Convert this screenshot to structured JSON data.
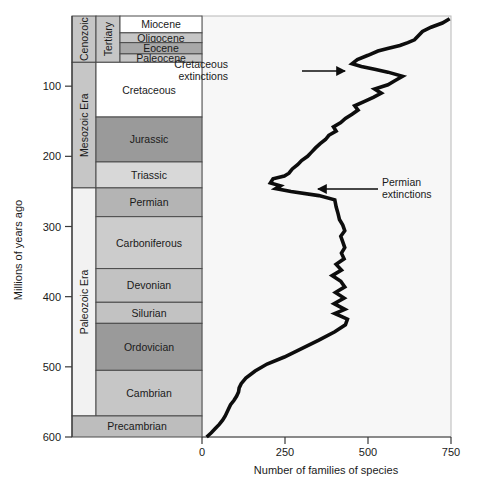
{
  "figure": {
    "width": 477,
    "height": 494
  },
  "axes": {
    "y_title": "Millions of years ago",
    "y_ticks": [
      "100",
      "200",
      "300",
      "400",
      "500",
      "600"
    ],
    "y_tick_values": [
      100,
      200,
      300,
      400,
      500,
      600
    ],
    "y_range": [
      0,
      600
    ],
    "x_title": "Number of families of species",
    "x_ticks": [
      "0",
      "250",
      "500",
      "750"
    ],
    "x_tick_values": [
      0,
      250,
      500,
      750
    ],
    "x_range": [
      0,
      750
    ]
  },
  "eras": [
    {
      "name": "Cenozoic",
      "label": "Cenozoic",
      "start": 0,
      "end": 66,
      "fill": "#c6c6c6"
    },
    {
      "name": "Mesozoic",
      "label": "Mesozoic Era",
      "start": 66,
      "end": 245,
      "fill": "#c6c6c6"
    },
    {
      "name": "Paleozoic",
      "label": "Paleozoic Era",
      "start": 245,
      "end": 570,
      "fill": "#f2f2f2"
    }
  ],
  "periods": [
    {
      "name": "Tertiary",
      "label": "Tertiary",
      "start": 0,
      "end": 66,
      "fill": "#c6c6c6"
    }
  ],
  "bands": [
    {
      "name": "Miocene",
      "label": "Miocene",
      "start": 0,
      "end": 24,
      "fill": "#ffffff",
      "col": "epoch"
    },
    {
      "name": "Oligocene",
      "label": "Oligocene",
      "start": 24,
      "end": 38,
      "fill": "#c6c6c6",
      "col": "epoch"
    },
    {
      "name": "Eocene",
      "label": "Eocene",
      "start": 38,
      "end": 54,
      "fill": "#a8a8a8",
      "col": "epoch"
    },
    {
      "name": "Paleocene",
      "label": "Paleocene",
      "start": 54,
      "end": 66,
      "fill": "#c6c6c6",
      "col": "epoch"
    },
    {
      "name": "Cretaceous",
      "label": "Cretaceous",
      "start": 66,
      "end": 144,
      "fill": "#ffffff",
      "col": "period"
    },
    {
      "name": "Jurassic",
      "label": "Jurassic",
      "start": 144,
      "end": 208,
      "fill": "#9a9a9a",
      "col": "period"
    },
    {
      "name": "Triassic",
      "label": "Triassic",
      "start": 208,
      "end": 245,
      "fill": "#d8d8d8",
      "col": "period"
    },
    {
      "name": "Permian",
      "label": "Permian",
      "start": 245,
      "end": 286,
      "fill": "#b4b4b4",
      "col": "period"
    },
    {
      "name": "Carboniferous",
      "label": "Carboniferous",
      "start": 286,
      "end": 360,
      "fill": "#cccccc",
      "col": "period"
    },
    {
      "name": "Devonian",
      "label": "Devonian",
      "start": 360,
      "end": 408,
      "fill": "#c2c2c2",
      "col": "period"
    },
    {
      "name": "Silurian",
      "label": "Silurian",
      "start": 408,
      "end": 438,
      "fill": "#c2c2c2",
      "col": "period"
    },
    {
      "name": "Ordovician",
      "label": "Ordovician",
      "start": 438,
      "end": 505,
      "fill": "#9a9a9a",
      "col": "period"
    },
    {
      "name": "Cambrian",
      "label": "Cambrian",
      "start": 505,
      "end": 570,
      "fill": "#c6c6c6",
      "col": "period"
    },
    {
      "name": "Precambrian",
      "label": "Precambrian",
      "start": 570,
      "end": 600,
      "fill": "#bdbdbd",
      "col": "full"
    }
  ],
  "annotations": [
    {
      "name": "cretaceous-extinctions",
      "line1": "Cretaceous",
      "line2": "extinctions",
      "text_x": 228,
      "text_y": 68,
      "arrow_from_x": 302,
      "arrow_to_x": 345,
      "arrow_y": 71
    },
    {
      "name": "permian-extinctions",
      "line1": "Permian",
      "line2": "extinctions",
      "text_x": 382,
      "text_y": 186,
      "arrow_from_x": 378,
      "arrow_to_x": 318,
      "arrow_y": 189
    }
  ],
  "chart_data": {
    "type": "line",
    "xlabel": "Number of families of species",
    "ylabel": "Millions of years ago",
    "xlim": [
      0,
      750
    ],
    "ylim": [
      600,
      0
    ],
    "grid": false,
    "legend": "none",
    "orientation": "x = families, y = time (inverted, 600 Ma at bottom)",
    "series": [
      {
        "name": "Families of species",
        "x": [
          14,
          28,
          40,
          52,
          62,
          70,
          78,
          86,
          96,
          104,
          110,
          112,
          118,
          132,
          160,
          196,
          248,
          300,
          352,
          400,
          432,
          438,
          400,
          430,
          398,
          428,
          402,
          430,
          418,
          392,
          420,
          404,
          428,
          420,
          430,
          424,
          418,
          430,
          424,
          414,
          410,
          404,
          400,
          352,
          268,
          222,
          236,
          206,
          214,
          248,
          262,
          272,
          288,
          300,
          318,
          330,
          342,
          356,
          372,
          382,
          404,
          396,
          418,
          432,
          452,
          470,
          460,
          488,
          516,
          540,
          520,
          560,
          582,
          604,
          560,
          520,
          480,
          452,
          468,
          500,
          530,
          562,
          596,
          620,
          640,
          648,
          656,
          664,
          690,
          724,
          746
        ],
        "y": [
          600,
          594,
          588,
          582,
          576,
          570,
          562,
          554,
          548,
          542,
          536,
          530,
          524,
          516,
          506,
          496,
          486,
          474,
          462,
          450,
          440,
          432,
          424,
          418,
          410,
          402,
          394,
          386,
          378,
          370,
          362,
          354,
          346,
          338,
          330,
          322,
          314,
          306,
          298,
          290,
          282,
          272,
          262,
          256,
          250,
          246,
          242,
          238,
          232,
          228,
          224,
          218,
          212,
          206,
          200,
          194,
          188,
          182,
          176,
          170,
          164,
          158,
          152,
          146,
          140,
          134,
          128,
          122,
          116,
          110,
          104,
          98,
          92,
          86,
          80,
          76,
          72,
          68,
          62,
          56,
          50,
          46,
          42,
          38,
          34,
          30,
          26,
          22,
          16,
          10,
          4
        ]
      }
    ],
    "annotations": [
      {
        "label": "Cretaceous extinctions",
        "at_y": 66,
        "note": "sharp drop in family count at end of Cretaceous"
      },
      {
        "label": "Permian extinctions",
        "at_y": 245,
        "note": "largest drop in family count at end of Permian"
      }
    ]
  }
}
